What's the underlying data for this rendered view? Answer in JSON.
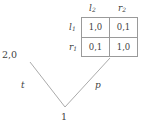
{
  "figure": {
    "type": "game-theory-diagram",
    "line_color": "#9a9a9a",
    "text_color": "#3f3f3f",
    "background": "#ffffff"
  },
  "tree": {
    "root": {
      "label": "1"
    },
    "edges": [
      {
        "name": "left-branch",
        "label": "t"
      },
      {
        "name": "right-branch",
        "label": "p"
      }
    ],
    "terminal_left": {
      "payoff": "2,0"
    }
  },
  "matrix": {
    "column_headers": [
      {
        "base": "l",
        "sub": "2"
      },
      {
        "base": "r",
        "sub": "2"
      }
    ],
    "row_headers": [
      {
        "base": "l",
        "sub": "1"
      },
      {
        "base": "r",
        "sub": "1"
      }
    ],
    "cells": [
      [
        "1,0",
        "0,1"
      ],
      [
        "0,1",
        "1,0"
      ]
    ]
  }
}
